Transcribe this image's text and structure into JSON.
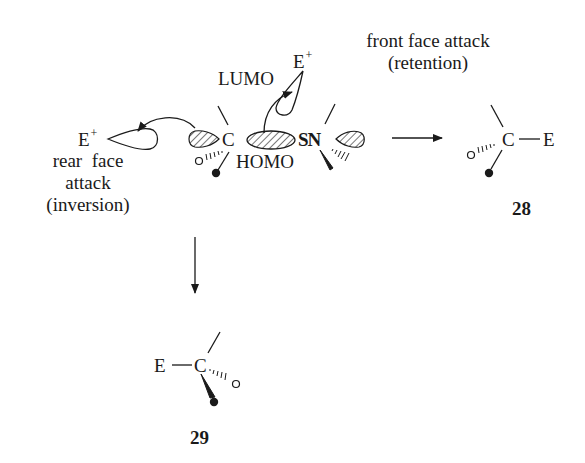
{
  "diagram": {
    "type": "reaction-scheme",
    "reagent": {
      "electrophile": "E",
      "charge": "+"
    },
    "orbitals": {
      "lumo_label": "LUMO",
      "homo_label": "HOMO"
    },
    "substrate": {
      "carbon": "C",
      "metal": "SN"
    },
    "pathways": {
      "rear": {
        "line1": "rear  face",
        "line2": "attack",
        "line3": "(inversion)"
      },
      "front": {
        "line1": "front face attack",
        "line2": "(retention)"
      }
    },
    "products": [
      {
        "id": "28",
        "carbon": "C",
        "group": "E",
        "stereo": "retention"
      },
      {
        "id": "29",
        "carbon": "C",
        "group": "E",
        "stereo": "inversion"
      }
    ],
    "colors": {
      "ink": "#1a1a1a",
      "background": "#ffffff"
    }
  }
}
